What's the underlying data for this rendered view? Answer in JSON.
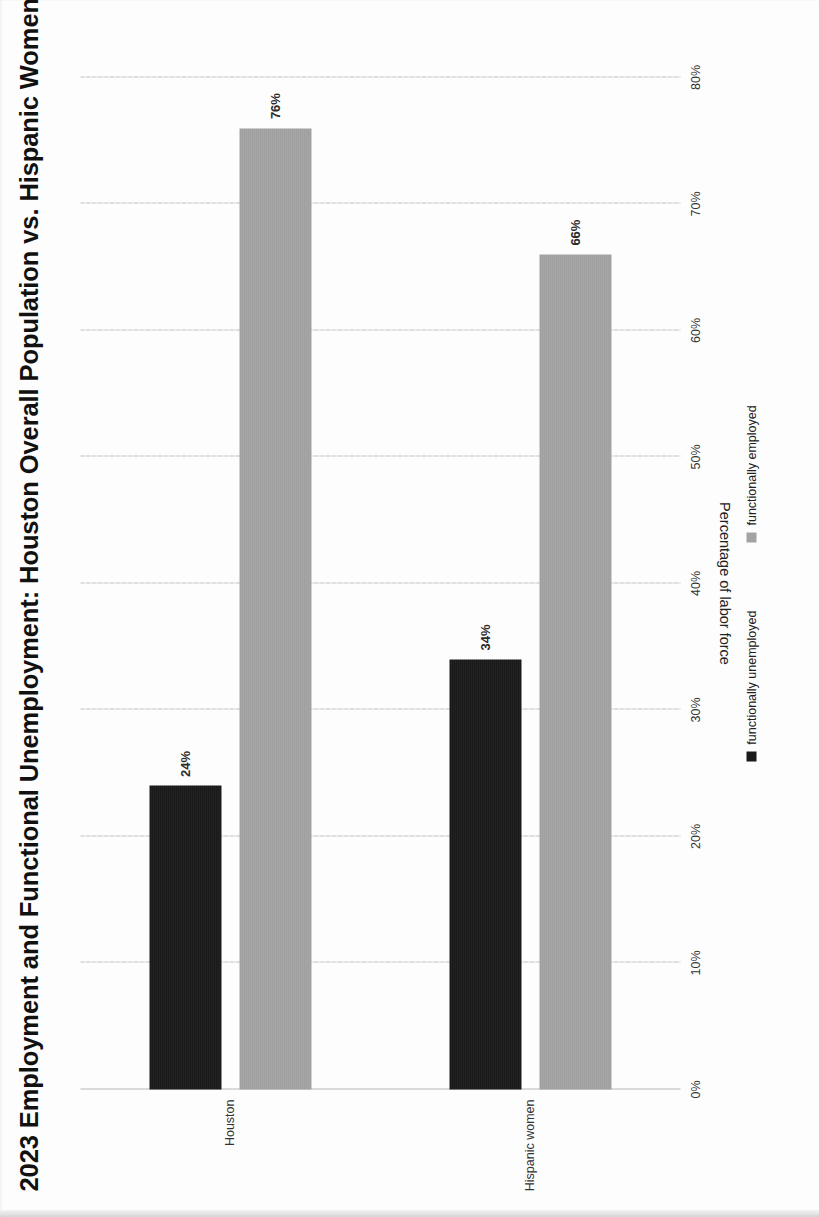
{
  "document": {
    "kind": "scanned-chart-page",
    "orientation": "rotated-90-ccw"
  },
  "chart_data": {
    "type": "bar",
    "orientation": "vertical",
    "title": "2023 Employment and Functional Unemployment: Houston Overall Population vs. Hispanic Women in Houston",
    "xlabel": "",
    "ylabel": "Percentage of labor force",
    "categories": [
      "Houston",
      "Hispanic women"
    ],
    "series": [
      {
        "name": "functionally unemployed",
        "color": "#1a1a1a",
        "values": [
          24,
          34
        ],
        "labels": [
          "24%",
          "34%"
        ]
      },
      {
        "name": "functionally employed",
        "color": "#a3a3a3",
        "values": [
          76,
          66
        ],
        "labels": [
          "76%",
          "66%"
        ]
      }
    ],
    "ylim": [
      0,
      80
    ],
    "ytick_values": [
      0,
      10,
      20,
      30,
      40,
      50,
      60,
      70,
      80
    ],
    "ytick_labels": [
      "0%",
      "10%",
      "20%",
      "30%",
      "40%",
      "50%",
      "60%",
      "70%",
      "80%"
    ],
    "grid": true,
    "grid_style": "dashed",
    "legend_position": "bottom"
  },
  "legend": {
    "items": [
      {
        "label": "functionally unemployed",
        "color": "#1a1a1a",
        "marker": "square-swatch-icon"
      },
      {
        "label": "functionally employed",
        "color": "#a3a3a3",
        "marker": "square-swatch-icon"
      }
    ]
  },
  "colors": {
    "unemployed": "#1a1a1a",
    "employed": "#a3a3a3",
    "grid": "#cfcfcf",
    "axis": "#b8b8b8",
    "text": "#111111",
    "page": "#fdfdfd"
  }
}
